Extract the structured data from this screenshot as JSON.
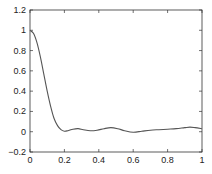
{
  "chart_data": {
    "type": "line",
    "title": "",
    "xlabel": "",
    "ylabel": "",
    "xlim": [
      0,
      1
    ],
    "ylim": [
      -0.2,
      1.2
    ],
    "grid": false,
    "legend": null,
    "x_ticks": [
      "0",
      "0.2",
      "0.4",
      "0.6",
      "0.8",
      "1"
    ],
    "y_ticks": [
      "-0.2",
      "0",
      "0.2",
      "0.4",
      "0.6",
      "0.8",
      "1",
      "1.2"
    ],
    "series": [
      {
        "name": "curve",
        "color": "#555555",
        "x": [
          0.0,
          0.02,
          0.04,
          0.06,
          0.08,
          0.1,
          0.12,
          0.14,
          0.16,
          0.18,
          0.2,
          0.22,
          0.25,
          0.28,
          0.31,
          0.35,
          0.39,
          0.43,
          0.47,
          0.51,
          0.55,
          0.6,
          0.65,
          0.7,
          0.75,
          0.8,
          0.85,
          0.9,
          0.93,
          0.96,
          1.0
        ],
        "y": [
          1.0,
          0.97,
          0.88,
          0.74,
          0.57,
          0.4,
          0.25,
          0.13,
          0.06,
          0.02,
          0.005,
          0.01,
          0.025,
          0.03,
          0.02,
          0.01,
          0.015,
          0.03,
          0.04,
          0.03,
          0.01,
          -0.005,
          0.005,
          0.015,
          0.02,
          0.025,
          0.03,
          0.04,
          0.045,
          0.04,
          0.03
        ]
      }
    ]
  }
}
